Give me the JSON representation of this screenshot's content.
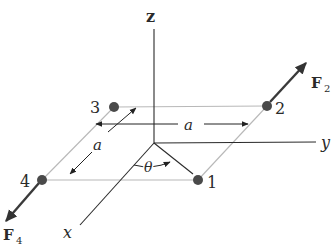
{
  "diagram": {
    "axes": {
      "z": "z",
      "y": "y",
      "x": "x"
    },
    "points": [
      {
        "id": "1",
        "label": "1"
      },
      {
        "id": "2",
        "label": "2"
      },
      {
        "id": "3",
        "label": "3"
      },
      {
        "id": "4",
        "label": "4"
      }
    ],
    "forces": {
      "F2": {
        "symbol": "F",
        "subscript": "2"
      },
      "F4": {
        "symbol": "F",
        "subscript": "4"
      }
    },
    "dimensions": {
      "side_horizontal": "a",
      "side_depth": "a",
      "angle": "θ"
    },
    "colors": {
      "axis": "#2a2a2a",
      "square_edge": "#b8b8b8",
      "point": "#4a4a4a",
      "force_arrow": "#3a3a3a"
    }
  }
}
